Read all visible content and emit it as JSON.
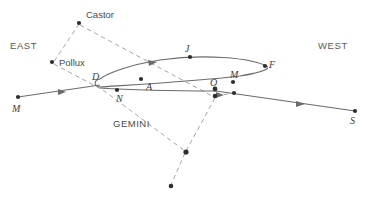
{
  "figure": {
    "type": "star-chart",
    "colors": {
      "background": "#ffffff",
      "path_line": "#6b6b6b",
      "dashed_line": "#9a9a9a",
      "star_dot": "#2e2e2e",
      "text": "#4a4a4a"
    }
  },
  "cardinals": {
    "east": "EAST",
    "west": "WEST"
  },
  "constellation": {
    "name": "GEMINI",
    "stars": [
      {
        "name": "Castor",
        "label": "Castor",
        "x": 79,
        "y": 23
      },
      {
        "name": "Pollux",
        "label": "Pollux",
        "x": 52,
        "y": 62
      },
      {
        "name": "star-lower-junction",
        "label": "",
        "x": 186,
        "y": 152
      },
      {
        "name": "star-lower-left",
        "label": "",
        "x": 171,
        "y": 186
      },
      {
        "name": "star-below-o",
        "label": "",
        "x": 215,
        "y": 96
      },
      {
        "name": "star-right-of-o",
        "label": "",
        "x": 234,
        "y": 93
      }
    ]
  },
  "path_markers": [
    {
      "label": "D",
      "x": 98,
      "y": 74
    },
    {
      "label": "J",
      "x": 189,
      "y": 49
    },
    {
      "label": "A",
      "x": 150,
      "y": 85
    },
    {
      "label": "M",
      "x": 234,
      "y": 75
    },
    {
      "label": "F",
      "x": 264,
      "y": 65
    },
    {
      "label": "O",
      "x": 215,
      "y": 85
    },
    {
      "label": "N",
      "x": 122,
      "y": 98
    }
  ],
  "endpoints": [
    {
      "label": "M",
      "x": 17,
      "y": 110,
      "direction": "east"
    },
    {
      "label": "S",
      "x": 355,
      "y": 120,
      "direction": "west"
    }
  ],
  "labels": {
    "castor": "Castor",
    "pollux": "Pollux",
    "gemini": "GEMINI",
    "east": "EAST",
    "west": "WEST",
    "marker_d": "D",
    "marker_j": "J",
    "marker_a": "A",
    "marker_m_loop": "M",
    "marker_f": "F",
    "marker_o": "O",
    "marker_n": "N",
    "endpoint_m": "M",
    "endpoint_s": "S"
  }
}
